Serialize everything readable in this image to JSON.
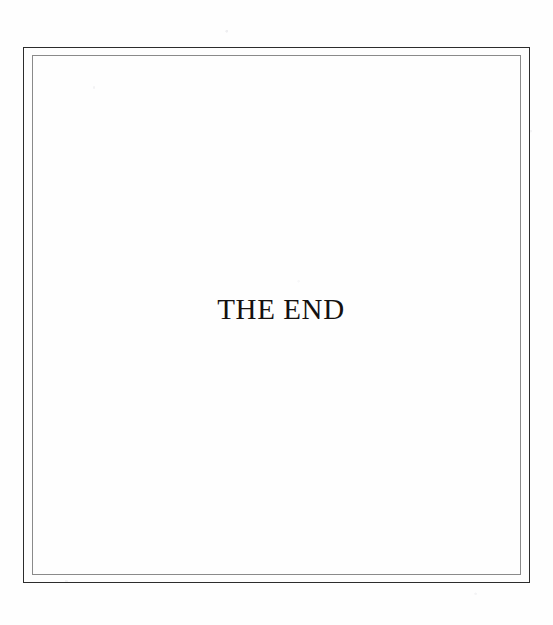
{
  "document": {
    "kind": "scanned-book-page",
    "page_type": "colophon",
    "background_color": "#fefefe"
  },
  "frame": {
    "style": "double-rule-border",
    "outer": {
      "name": "outer-rule",
      "color": "#2c2c2c",
      "thickness_px": 1.5,
      "x": 23,
      "y": 47,
      "width": 507,
      "height": 536
    },
    "inner": {
      "name": "inner-rule",
      "color": "#8a8a8a",
      "thickness_px": 1,
      "x": 32,
      "y": 55,
      "width": 489,
      "height": 520
    }
  },
  "content": {
    "end_text": "THE END",
    "text_color": "#15110f",
    "font_size_px": 29,
    "alignment": "center"
  }
}
